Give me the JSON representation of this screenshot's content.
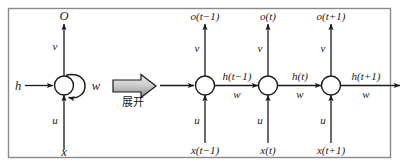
{
  "figure": {
    "border_color": "#7a7a7a",
    "stroke_color": "#1a1a1a",
    "node_fill": "#ffffff",
    "arrow_fill_light": "#e8e8e8",
    "arrow_fill_dark": "#8c8c8c"
  },
  "folded": {
    "output_label": "O",
    "output_weight": "v",
    "input_label": "x",
    "input_weight": "u",
    "hidden_input_label": "h",
    "recurrent_weight": "w",
    "node_name": "hidden-state-node"
  },
  "unfold": {
    "label": "展开",
    "arrow_name": "unfold-block-arrow"
  },
  "unrolled": {
    "timesteps": [
      {
        "output": "o(t−1)",
        "output_weight": "v",
        "input": "x(t−1)",
        "input_weight": "u",
        "hidden_out": "h(t−1)",
        "hidden_weight": "w"
      },
      {
        "output": "o(t)",
        "output_weight": "v",
        "input": "x(t)",
        "input_weight": "u",
        "hidden_out": "h(t)",
        "hidden_weight": "w"
      },
      {
        "output": "o(t+1)",
        "output_weight": "v",
        "input": "x(t+1)",
        "input_weight": "u",
        "hidden_out": "h(t+1)",
        "hidden_weight": "w"
      }
    ]
  }
}
